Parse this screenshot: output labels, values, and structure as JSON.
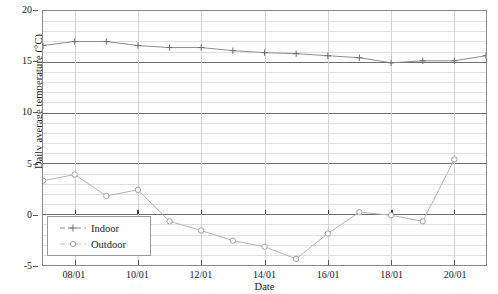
{
  "chart_data": {
    "type": "line",
    "title": "",
    "xlabel": "Date",
    "ylabel": "Daily average temperature (°C)",
    "ylim": [
      -5,
      20
    ],
    "y_ticks": [
      20,
      15,
      10,
      5,
      0,
      -5
    ],
    "y_tick_labels": [
      "20",
      "15",
      "10",
      "5",
      "0",
      "-5"
    ],
    "y_minor_step": 1,
    "grid": "major and minor horizontal gridlines; vertical gridlines at each labelled date",
    "legend_position": "lower left inside axes",
    "x_range": [
      "07/01",
      "21/01"
    ],
    "x_ticks": [
      "08/01",
      "10/01",
      "12/01",
      "14/01",
      "16/01",
      "18/01",
      "20/01"
    ],
    "x": [
      "07/01",
      "08/01",
      "09/01",
      "10/01",
      "11/01",
      "12/01",
      "13/01",
      "14/01",
      "15/01",
      "16/01",
      "17/01",
      "18/01",
      "19/01",
      "20/01",
      "21/01"
    ],
    "series": [
      {
        "name": "Indoor",
        "marker": "plus",
        "color": "#8c8c8c",
        "values": [
          16.6,
          17.0,
          17.0,
          16.6,
          16.4,
          16.4,
          16.1,
          15.9,
          15.8,
          15.6,
          15.4,
          14.9,
          15.1,
          15.1,
          15.6
        ]
      },
      {
        "name": "Outdoor",
        "marker": "circle",
        "color": "#b3b3b3",
        "values": [
          3.3,
          3.9,
          1.8,
          2.4,
          -0.7,
          -1.6,
          -2.6,
          -3.2,
          -4.4,
          -1.9,
          0.2,
          -0.1,
          -0.7,
          5.4,
          null
        ]
      }
    ]
  },
  "legend": {
    "items": [
      {
        "label": "Indoor",
        "marker": "plus-marker"
      },
      {
        "label": "Outdoor",
        "marker": "circle-marker"
      }
    ]
  },
  "axes": {
    "y_title": "Daily average temperature (°C)",
    "x_title": "Date",
    "y_tick_labels": [
      "20",
      "15",
      "10",
      "5",
      "0",
      "-5"
    ],
    "x_tick_labels": [
      "08/01",
      "10/01",
      "12/01",
      "14/01",
      "16/01",
      "18/01",
      "20/01"
    ]
  },
  "colors": {
    "indoor": "#8c8c8c",
    "outdoor": "#b3b3b3",
    "major_grid": "#6e6e6e",
    "minor_grid": "#d8d8d8",
    "frame": "#8a8a8a"
  }
}
